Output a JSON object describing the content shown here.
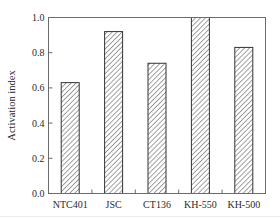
{
  "chart_data": {
    "type": "bar",
    "title": "",
    "xlabel": "",
    "ylabel": "Activation index",
    "categories": [
      "NTC401",
      "JSC",
      "CT136",
      "KH-550",
      "KH-500"
    ],
    "values": [
      0.63,
      0.92,
      0.74,
      1.0,
      0.83
    ],
    "ylim": [
      0.0,
      1.0
    ],
    "yticks": [
      0.0,
      0.2,
      0.4,
      0.6,
      0.8,
      1.0
    ],
    "ytick_labels": [
      "0.0",
      "0.2",
      "0.4",
      "0.6",
      "0.8",
      "1.0"
    ],
    "grid": false,
    "legend": null,
    "bar_style": "diagonal-hatch",
    "colors": {
      "frame": "#6b6b6b",
      "bar_border": "#333333",
      "hatch": "#555555",
      "text": "#2a2a2a"
    }
  }
}
